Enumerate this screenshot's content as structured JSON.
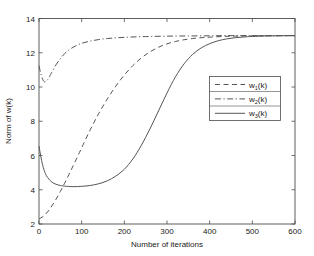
{
  "chart_data": {
    "type": "line",
    "title": "",
    "xlabel": "Number of iterations",
    "ylabel": "Norm of w(k)",
    "xlim": [
      0,
      600
    ],
    "ylim": [
      2,
      14
    ],
    "xticks": [
      0,
      100,
      200,
      300,
      400,
      500,
      600
    ],
    "yticks": [
      2,
      4,
      6,
      8,
      10,
      12,
      14
    ],
    "xtick_labels": [
      "0",
      "100",
      "200",
      "300",
      "400",
      "500",
      "600"
    ],
    "ytick_labels": [
      "2",
      "4",
      "6",
      "8",
      "10",
      "12",
      "14"
    ],
    "grid": false,
    "legend_position": "center-right",
    "series": [
      {
        "name": "w_1(k)",
        "label_base": "w",
        "label_sub": "1",
        "label_tail": "(k)",
        "style": "dashed",
        "color": "#555555",
        "x": [
          0,
          10,
          20,
          30,
          40,
          50,
          60,
          70,
          80,
          90,
          100,
          120,
          140,
          160,
          180,
          200,
          220,
          240,
          260,
          280,
          300,
          320,
          340,
          360,
          380,
          400,
          430,
          460,
          500,
          550,
          600
        ],
        "y": [
          2.3,
          2.45,
          2.7,
          3.05,
          3.45,
          3.9,
          4.38,
          4.88,
          5.4,
          5.92,
          6.45,
          7.5,
          8.45,
          9.3,
          10.05,
          10.7,
          11.25,
          11.7,
          12.05,
          12.32,
          12.52,
          12.66,
          12.76,
          12.83,
          12.88,
          12.91,
          12.95,
          12.97,
          12.99,
          13.0,
          13.0
        ]
      },
      {
        "name": "w_2(k)",
        "label_base": "w",
        "label_sub": "2",
        "label_tail": "(k)",
        "style": "dashdot",
        "color": "#555555",
        "x": [
          0,
          5,
          10,
          15,
          20,
          25,
          30,
          40,
          50,
          60,
          70,
          80,
          90,
          100,
          110,
          120,
          140,
          160,
          180,
          200,
          230,
          260,
          300,
          350,
          400,
          450,
          500,
          550,
          600
        ],
        "y": [
          11.25,
          10.7,
          10.38,
          10.3,
          10.42,
          10.62,
          10.86,
          11.3,
          11.66,
          11.95,
          12.16,
          12.32,
          12.45,
          12.55,
          12.62,
          12.68,
          12.77,
          12.83,
          12.87,
          12.9,
          12.93,
          12.95,
          12.97,
          12.98,
          12.99,
          13.0,
          13.0,
          13.0,
          13.0
        ]
      },
      {
        "name": "w_3(k)",
        "label_base": "w",
        "label_sub": "3",
        "label_tail": "(k)",
        "style": "solid",
        "color": "#555555",
        "x": [
          0,
          5,
          10,
          15,
          20,
          30,
          40,
          50,
          60,
          80,
          100,
          120,
          140,
          160,
          180,
          200,
          220,
          240,
          260,
          280,
          300,
          320,
          340,
          360,
          380,
          400,
          420,
          440,
          460,
          480,
          500,
          540,
          600
        ],
        "y": [
          6.55,
          5.85,
          5.3,
          4.95,
          4.72,
          4.45,
          4.32,
          4.25,
          4.21,
          4.18,
          4.2,
          4.25,
          4.35,
          4.52,
          4.8,
          5.2,
          5.8,
          6.6,
          7.55,
          8.6,
          9.65,
          10.6,
          11.35,
          11.9,
          12.28,
          12.53,
          12.7,
          12.81,
          12.88,
          12.92,
          12.95,
          12.98,
          13.0
        ]
      }
    ]
  },
  "legend": {
    "entries": [
      {
        "label_base": "w",
        "label_sub": "1",
        "label_tail": "(k)",
        "style": "dashed"
      },
      {
        "label_base": "w",
        "label_sub": "2",
        "label_tail": "(k)",
        "style": "dashdot"
      },
      {
        "label_base": "w",
        "label_sub": "3",
        "label_tail": "(k)",
        "style": "solid"
      }
    ]
  }
}
